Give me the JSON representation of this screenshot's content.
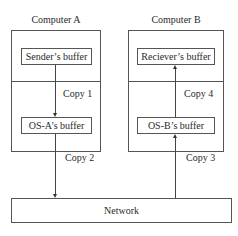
{
  "computer_a": {
    "title": "Computer A",
    "top_buffer": "Sender’s buffer",
    "bottom_buffer": "OS-A’s buffer"
  },
  "computer_b": {
    "title": "Computer B",
    "top_buffer": "Reciever’s buffer",
    "bottom_buffer": "OS-B’s buffer"
  },
  "network": {
    "label": "Network"
  },
  "copies": {
    "copy1": "Copy 1",
    "copy2": "Copy 2",
    "copy3": "Copy 3",
    "copy4": "Copy 4"
  }
}
